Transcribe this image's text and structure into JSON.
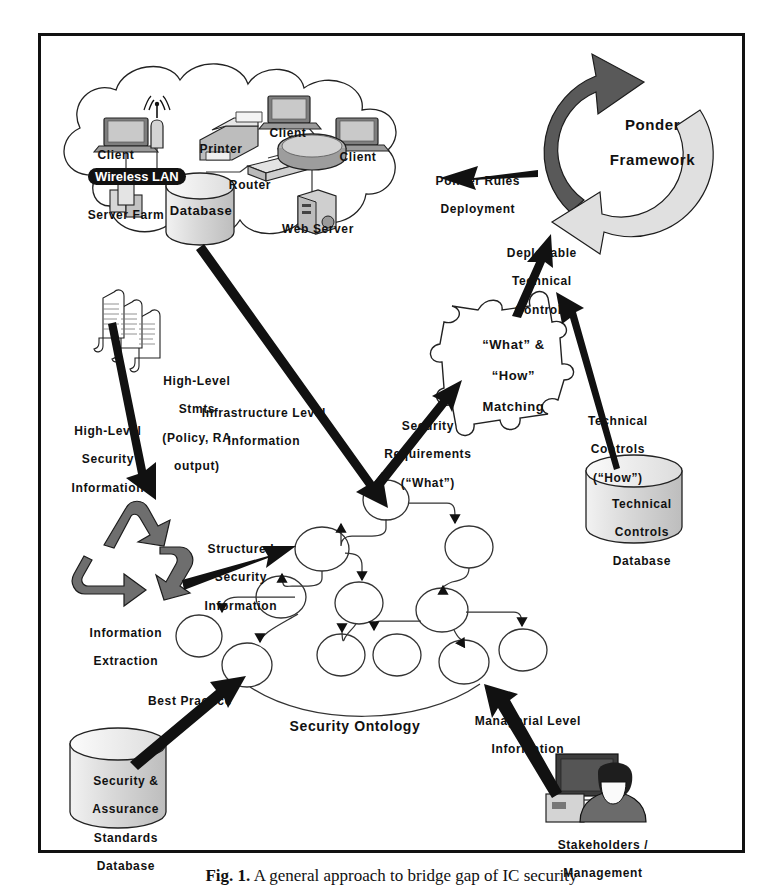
{
  "figure": {
    "caption_prefix": "Fig. 1.",
    "caption_text": "A general approach to bridge gap of IC security",
    "border_color": "#111111"
  },
  "network_cloud": {
    "name": "network-infrastructure-cloud",
    "nodes": [
      {
        "id": "client-left",
        "label": "Client",
        "icon": "laptop-icon"
      },
      {
        "id": "client-top",
        "label": "Client",
        "icon": "laptop-icon"
      },
      {
        "id": "client-right",
        "label": "Client",
        "icon": "laptop-icon"
      },
      {
        "id": "printer",
        "label": "Printer",
        "icon": "printer-icon"
      },
      {
        "id": "router",
        "label": "Router",
        "icon": "router-icon"
      },
      {
        "id": "server-farm",
        "label": "Server Farm",
        "icon": "server-stack-icon"
      },
      {
        "id": "database",
        "label": "Database",
        "icon": "cylinder-database-icon"
      },
      {
        "id": "web-server",
        "label": "Web Server",
        "icon": "server-tower-icon"
      },
      {
        "id": "wireless-ap",
        "label": "",
        "icon": "wireless-antenna-icon"
      }
    ],
    "wireless_lan_badge": "Wireless LAN"
  },
  "ponder": {
    "title_line1": "Ponder",
    "title_line2": "Framework",
    "arrow_dark_color": "#595959",
    "arrow_light_color": "#e0e0e0"
  },
  "matching": {
    "line1": "“What” &",
    "line2": "“How”",
    "line3": "Matching",
    "shape": "puzzle-piece"
  },
  "documents": {
    "line1": "High-Level",
    "line2": "Stmts",
    "line3": "(Policy, RA",
    "line4": "output)",
    "icon": "scroll-documents-icon"
  },
  "extraction": {
    "line1": "Information",
    "line2": "Extraction",
    "icon": "recycle-arrows-icon",
    "color": "#6e6e6e"
  },
  "databases": [
    {
      "id": "technical-controls-db",
      "lines": [
        "Technical",
        "Controls",
        "Database"
      ],
      "icon": "cylinder-database-icon"
    },
    {
      "id": "security-standards-db",
      "lines": [
        "Security &",
        "Assurance",
        "Standards",
        "Database"
      ],
      "icon": "cylinder-database-icon"
    }
  ],
  "stakeholders": {
    "line1": "Stakeholders /",
    "line2": "Management",
    "icon": "person-at-computer-icon"
  },
  "ontology": {
    "label": "Security Ontology",
    "node_count": 15,
    "node_shape": "ellipse"
  },
  "flow_labels": [
    {
      "id": "ponder-rules-deployment",
      "lines": [
        "Ponder Rules",
        "Deployment"
      ]
    },
    {
      "id": "deployable-technical-controls",
      "lines": [
        "Deployable",
        "Technical",
        "Controls"
      ]
    },
    {
      "id": "technical-controls-how",
      "lines": [
        "Technical",
        "Controls",
        "(“How”)"
      ]
    },
    {
      "id": "security-requirements-what",
      "lines": [
        "Security",
        "Requirements",
        "(“What”)"
      ]
    },
    {
      "id": "infrastructure-level-information",
      "lines": [
        "Infrastructure Level",
        "Information"
      ]
    },
    {
      "id": "high-level-security-information",
      "lines": [
        "High-Level",
        "Security",
        "Information"
      ]
    },
    {
      "id": "structured-security-information",
      "lines": [
        "Structured",
        "Security",
        "Information"
      ]
    },
    {
      "id": "best-practice",
      "lines": [
        "Best Practice"
      ]
    },
    {
      "id": "managerial-level-information",
      "lines": [
        "Managerial Level",
        "Information"
      ]
    }
  ]
}
